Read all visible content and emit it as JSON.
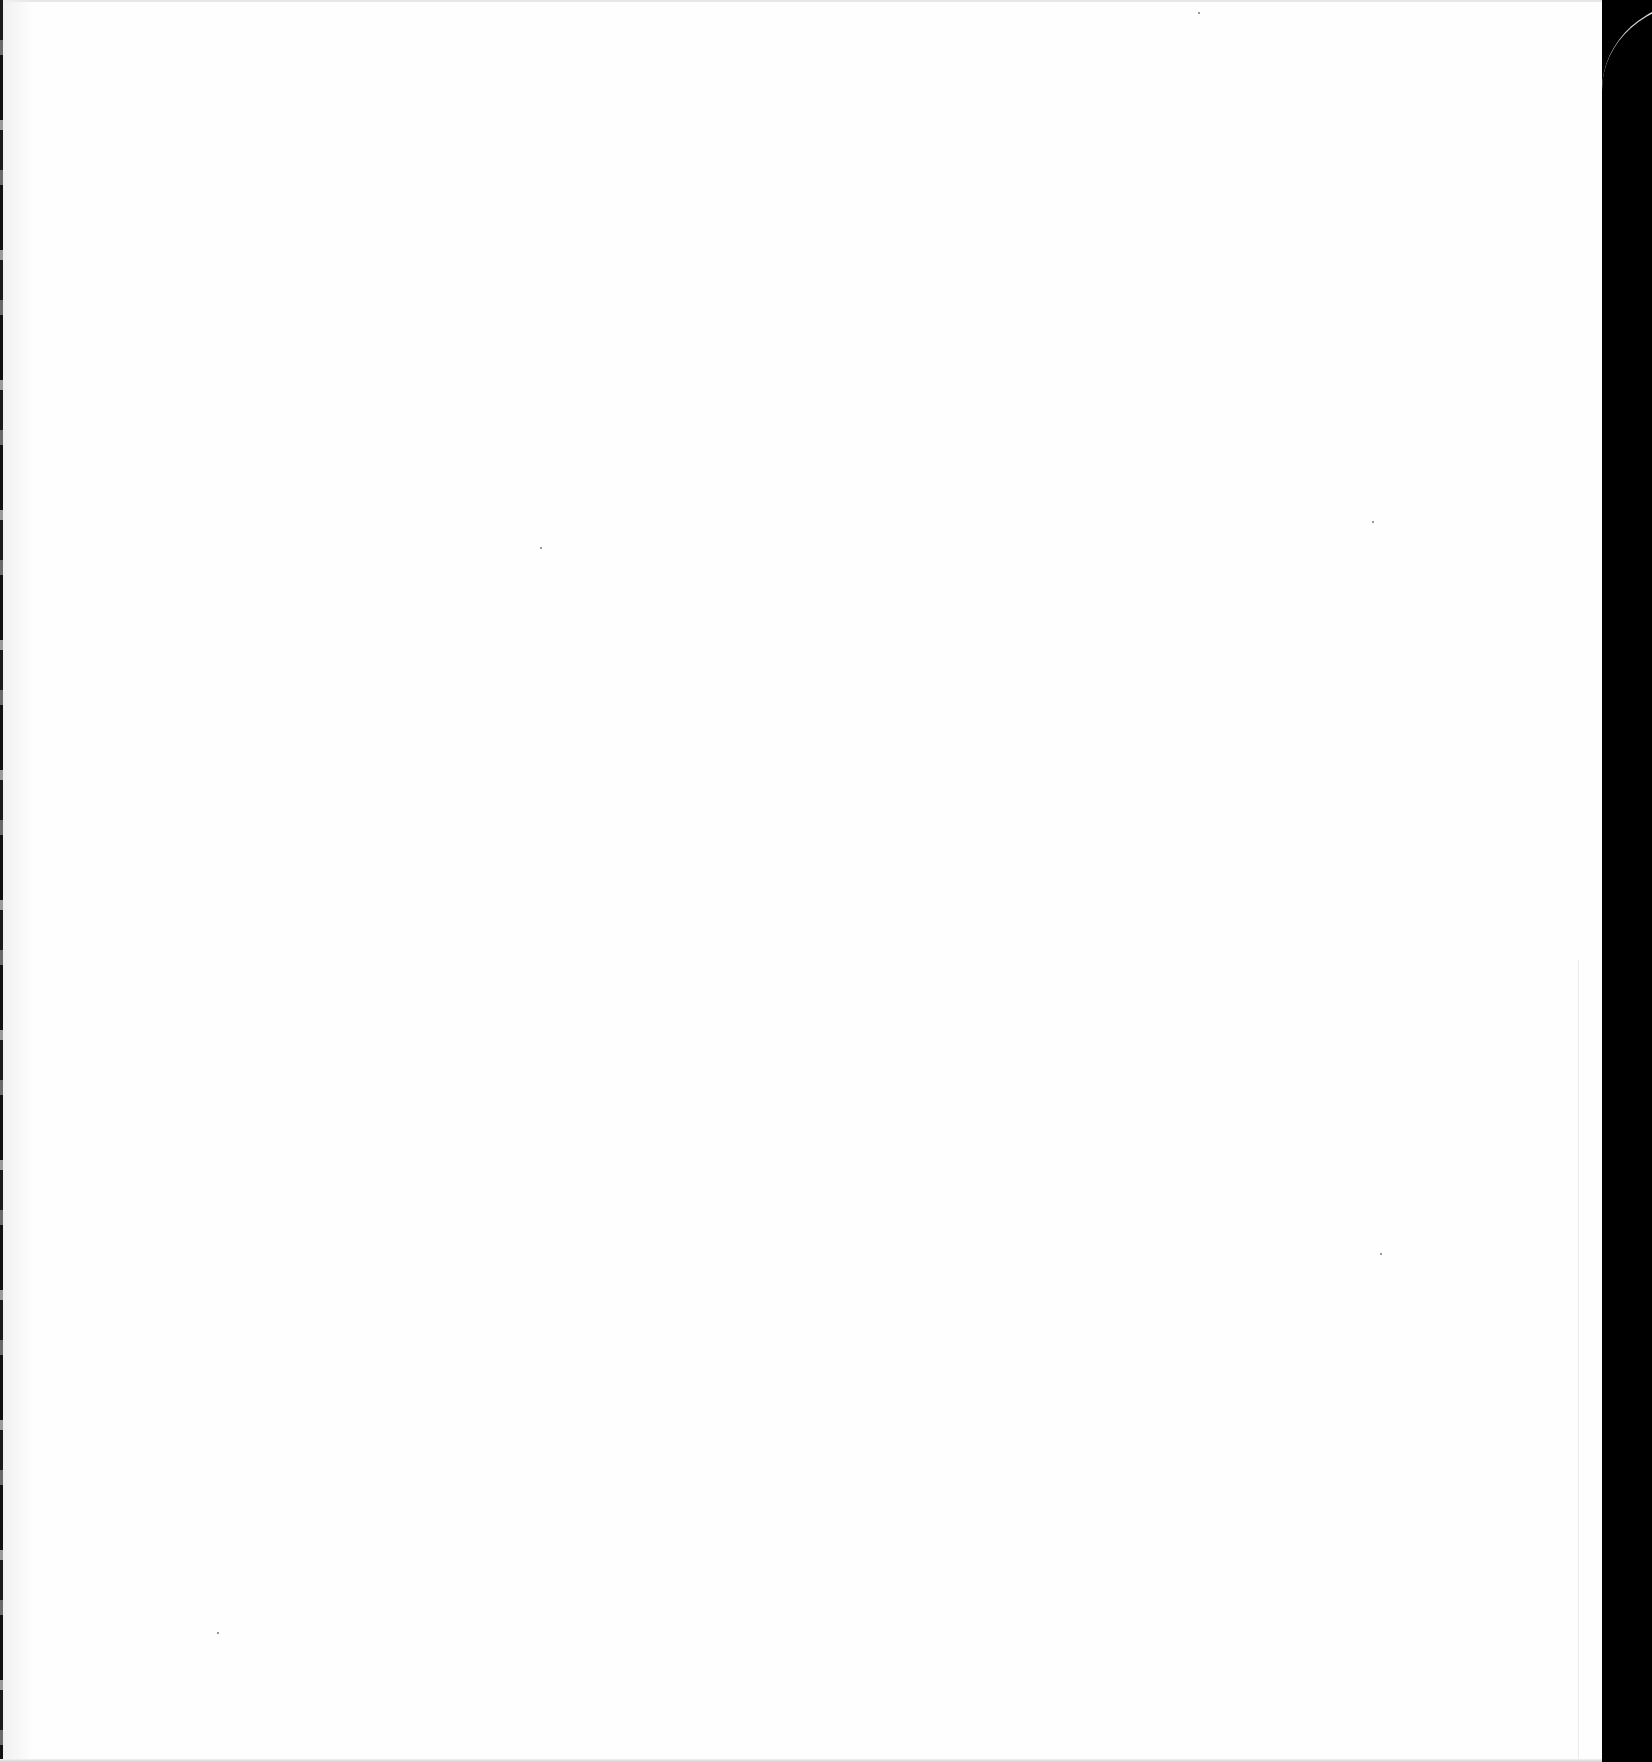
{
  "document": {
    "type": "scanned-page",
    "content": "",
    "is_blank": true
  },
  "colors": {
    "page_background": "#fefefe",
    "right_margin": "#000000",
    "left_scan_edge": "#1a1a1a"
  },
  "artifacts": {
    "specks": [
      {
        "x": 540,
        "y": 547
      },
      {
        "x": 1372,
        "y": 521
      },
      {
        "x": 1380,
        "y": 1253
      },
      {
        "x": 217,
        "y": 1632
      },
      {
        "x": 1198,
        "y": 12
      }
    ]
  }
}
